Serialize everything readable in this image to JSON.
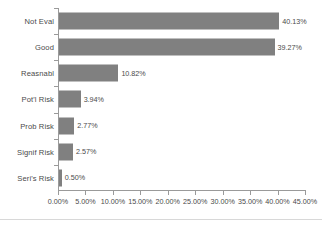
{
  "chart_data": {
    "type": "bar",
    "orientation": "horizontal",
    "title": "",
    "xlabel": "",
    "ylabel": "",
    "categories": [
      "Not Eval",
      "Good",
      "Reasnabl",
      "Pot'l Risk",
      "Prob Risk",
      "Signif Risk",
      "Seri's Risk"
    ],
    "values": [
      40.13,
      39.27,
      10.82,
      3.94,
      2.77,
      2.57,
      0.5
    ],
    "value_labels": [
      "40.13%",
      "39.27%",
      "10.82%",
      "3.94%",
      "2.77%",
      "2.57%",
      "0.50%"
    ],
    "xlim": [
      0,
      45
    ],
    "xticks": [
      0,
      5,
      10,
      15,
      20,
      25,
      30,
      35,
      40,
      45
    ],
    "xtick_labels": [
      "0.00%",
      "5.00%",
      "10.00%",
      "15.00%",
      "20.00%",
      "25.00%",
      "30.00%",
      "35.00%",
      "40.00%",
      "45.00%"
    ],
    "grid": false,
    "legend": false,
    "bar_color": "#808080",
    "axis_color": "#9a9a9a",
    "text_color": "#4a4a4a",
    "background": "#ffffff"
  }
}
